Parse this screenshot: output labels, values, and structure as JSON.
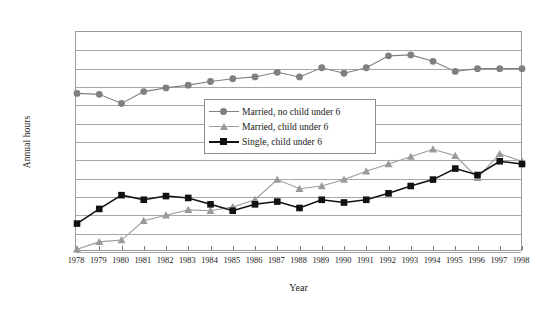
{
  "chart_data": {
    "type": "line",
    "title": "",
    "xlabel": "Year",
    "ylabel": "Annual hours",
    "x": [
      1978,
      1979,
      1980,
      1981,
      1982,
      1983,
      1984,
      1985,
      1986,
      1987,
      1988,
      1989,
      1990,
      1991,
      1992,
      1993,
      1994,
      1995,
      1996,
      1997,
      1998
    ],
    "xtick_labels": [
      "1978",
      "1979",
      "1980",
      "1981",
      "1982",
      "1983",
      "1984",
      "1985",
      "1986",
      "1987",
      "1988",
      "1989",
      "1990",
      "1991",
      "1992",
      "1993",
      "1994",
      "1995",
      "1996",
      "1997",
      "1998"
    ],
    "ytick_labels": [
      "200.0",
      "100.0",
      "0.0",
      "-100.0",
      "-200.0",
      "-300.0",
      "-400.0",
      "-500.0",
      "-600.0",
      "-700.0",
      "-800.0",
      "-900.0",
      "-1000.0"
    ],
    "ylim": [
      -1000,
      200
    ],
    "xlim": [
      1978,
      1998
    ],
    "ytick_values": [
      200,
      100,
      0,
      -100,
      -200,
      -300,
      -400,
      -500,
      -600,
      -700,
      -800,
      -900,
      -1000
    ],
    "grid": true,
    "legend_position": "center",
    "series": [
      {
        "name": "Married, no child under 6",
        "marker": "circle",
        "color": "#808080",
        "values": [
          -135,
          -140,
          -190,
          -125,
          -105,
          -90,
          -70,
          -55,
          -45,
          -20,
          -45,
          5,
          -25,
          5,
          70,
          75,
          40,
          -15,
          0,
          0,
          0
        ]
      },
      {
        "name": "Married, child under 6",
        "marker": "triangle",
        "color": "#9a9a9a",
        "values": [
          -985,
          -945,
          -935,
          -830,
          -800,
          -770,
          -775,
          -755,
          -715,
          -605,
          -655,
          -640,
          -605,
          -560,
          -520,
          -480,
          -440,
          -475,
          -595,
          -465,
          -505
        ]
      },
      {
        "name": "Single, child under 6",
        "marker": "square",
        "color": "#111111",
        "values": [
          -845,
          -765,
          -690,
          -715,
          -695,
          -705,
          -740,
          -775,
          -740,
          -725,
          -760,
          -715,
          -730,
          -715,
          -680,
          -640,
          -605,
          -545,
          -580,
          -505,
          -520
        ]
      }
    ]
  },
  "axes": {
    "y_title": "Annual hours",
    "x_title": "Year"
  },
  "legend": {
    "items": [
      {
        "label": "Married, no child under 6",
        "marker": "circle-marker",
        "color": "#808080"
      },
      {
        "label": "Married, child under 6",
        "marker": "triangle-marker",
        "color": "#9a9a9a"
      },
      {
        "label": "Single, child under 6",
        "marker": "square-marker",
        "color": "#111111"
      }
    ]
  }
}
